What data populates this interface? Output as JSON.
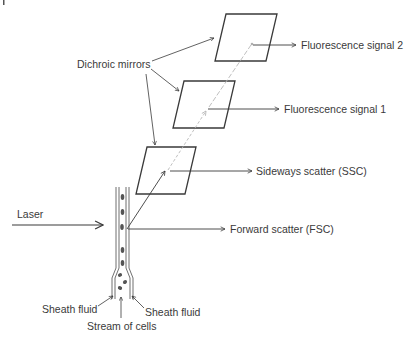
{
  "diagram": {
    "labels": {
      "dichroic_mirrors": "Dichroic mirrors",
      "fluorescence_signal_2": "Fluorescence signal 2",
      "fluorescence_signal_1": "Fluorescence signal 1",
      "sideways_scatter": "Sideways scatter (SSC)",
      "forward_scatter": "Forward scatter (FSC)",
      "laser": "Laser",
      "sheath_fluid_left": "Sheath fluid",
      "sheath_fluid_right": "Sheath fluid",
      "stream_of_cells": "Stream of cells"
    },
    "colors": {
      "line": "#3a3a3a",
      "beam_faint": "#b8b8b8",
      "cell": "#555555",
      "background": "#ffffff"
    },
    "mirrors": [
      {
        "name": "mirror-top",
        "signal": "Fluorescence signal 2"
      },
      {
        "name": "mirror-middle",
        "signal": "Fluorescence signal 1"
      },
      {
        "name": "mirror-bottom",
        "signal": "Sideways scatter (SSC)"
      }
    ]
  }
}
